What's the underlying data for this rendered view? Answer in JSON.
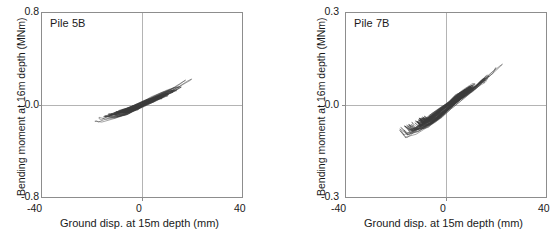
{
  "figure": {
    "background_color": "#ffffff",
    "frame_color": "#8d8d8d",
    "gridline_color": "#b4b4b4",
    "series_color": "#3a3a3a"
  },
  "panels": [
    {
      "title": "Pile 5B",
      "xlabel": "Ground disp. at 15m depth (mm)",
      "ylabel": "Bending moment at 16m depth (MNm)",
      "xticks": [
        "-40",
        "0",
        "40"
      ],
      "yticks": [
        "0.8",
        "0.0",
        "-0.8"
      ]
    },
    {
      "title": "Pile 7B",
      "xlabel": "Ground disp. at 15m depth (mm)",
      "ylabel": "Bending moment at 16m depth (MNm)",
      "xticks": [
        "-40",
        "0",
        "40"
      ],
      "yticks": [
        "0.3",
        "0.0",
        "-0.3"
      ]
    }
  ],
  "chart_data": [
    {
      "type": "line",
      "title": "Pile 5B",
      "xlabel": "Ground disp. at 15m depth (mm)",
      "ylabel": "Bending moment at 16m depth (MNm)",
      "xlim": [
        -40,
        40
      ],
      "ylim": [
        -0.8,
        0.8
      ],
      "xticks": [
        -40,
        0,
        40
      ],
      "yticks": [
        -0.8,
        0.0,
        0.8
      ],
      "grid": "zero-axes-only",
      "legend": "none",
      "description": "Hysteresis loops of bending moment versus ground displacement; narrow elongated cycles with positive slope passing through the origin.",
      "loops": [
        {
          "name": "outer-envelope",
          "x": [
            -20,
            -17,
            -12,
            -6,
            0,
            6,
            11,
            16,
            20,
            22,
            21,
            18,
            13,
            7,
            1,
            -5,
            -11,
            -16,
            -19,
            -20
          ],
          "y": [
            -0.14,
            -0.16,
            -0.13,
            -0.08,
            -0.01,
            0.07,
            0.13,
            0.18,
            0.23,
            0.25,
            0.24,
            0.2,
            0.14,
            0.08,
            0.02,
            -0.04,
            -0.09,
            -0.13,
            -0.15,
            -0.14
          ]
        },
        {
          "name": "mid-loop-1",
          "x": [
            -16,
            -12,
            -7,
            -2,
            4,
            9,
            14,
            16,
            14,
            10,
            5,
            0,
            -5,
            -10,
            -14,
            -16
          ],
          "y": [
            -0.11,
            -0.12,
            -0.09,
            -0.04,
            0.03,
            0.08,
            0.13,
            0.15,
            0.15,
            0.12,
            0.07,
            0.02,
            -0.03,
            -0.07,
            -0.1,
            -0.11
          ]
        },
        {
          "name": "mid-loop-2",
          "x": [
            -13,
            -9,
            -5,
            0,
            5,
            9,
            12,
            13,
            11,
            7,
            3,
            -2,
            -7,
            -11,
            -13
          ],
          "y": [
            -0.09,
            -0.09,
            -0.06,
            -0.01,
            0.04,
            0.08,
            0.11,
            0.12,
            0.11,
            0.08,
            0.05,
            0.0,
            -0.04,
            -0.07,
            -0.09
          ]
        },
        {
          "name": "core-cluster",
          "x": [
            -10,
            -7,
            -3,
            1,
            5,
            8,
            10,
            9,
            6,
            2,
            -2,
            -6,
            -9,
            -10
          ],
          "y": [
            -0.07,
            -0.07,
            -0.04,
            0.01,
            0.05,
            0.08,
            0.09,
            0.09,
            0.06,
            0.02,
            -0.02,
            -0.05,
            -0.07,
            -0.07
          ]
        }
      ]
    },
    {
      "type": "line",
      "title": "Pile 7B",
      "xlabel": "Ground disp. at 15m depth (mm)",
      "ylabel": "Bending moment at 16m depth (MNm)",
      "xlim": [
        -40,
        40
      ],
      "ylim": [
        -0.3,
        0.3
      ],
      "xticks": [
        -40,
        0,
        40
      ],
      "yticks": [
        -0.3,
        0.0,
        0.3
      ],
      "grid": "zero-axes-only",
      "legend": "none",
      "description": "Hysteresis loops of bending moment versus ground displacement; broader S-shaped cycles with positive slope passing near the origin, wider spread than Pile 5B.",
      "loops": [
        {
          "name": "outer-envelope",
          "x": [
            -19,
            -21,
            -19,
            -14,
            -8,
            -1,
            6,
            12,
            17,
            21,
            24,
            25,
            23,
            19,
            13,
            6,
            -1,
            -8,
            -14,
            -18,
            -19
          ],
          "y": [
            -0.12,
            -0.1,
            -0.12,
            -0.11,
            -0.08,
            -0.03,
            0.02,
            0.06,
            0.09,
            0.12,
            0.14,
            0.15,
            0.13,
            0.1,
            0.06,
            0.02,
            -0.02,
            -0.06,
            -0.1,
            -0.12,
            -0.12
          ]
        },
        {
          "name": "mid-loop-1",
          "x": [
            -17,
            -19,
            -16,
            -11,
            -5,
            2,
            8,
            13,
            17,
            19,
            18,
            14,
            9,
            3,
            -3,
            -9,
            -14,
            -17
          ],
          "y": [
            -0.1,
            -0.08,
            -0.1,
            -0.09,
            -0.06,
            -0.01,
            0.03,
            0.06,
            0.09,
            0.1,
            0.1,
            0.07,
            0.04,
            0.01,
            -0.03,
            -0.06,
            -0.09,
            -0.1
          ]
        },
        {
          "name": "mid-loop-2",
          "x": [
            -14,
            -16,
            -13,
            -8,
            -3,
            3,
            8,
            12,
            14,
            13,
            9,
            4,
            -1,
            -7,
            -12,
            -14
          ],
          "y": [
            -0.09,
            -0.07,
            -0.09,
            -0.08,
            -0.05,
            0.0,
            0.04,
            0.06,
            0.08,
            0.08,
            0.06,
            0.03,
            -0.01,
            -0.05,
            -0.08,
            -0.09
          ]
        },
        {
          "name": "core-cluster",
          "x": [
            -11,
            -13,
            -10,
            -6,
            -1,
            4,
            8,
            11,
            12,
            10,
            6,
            2,
            -3,
            -8,
            -11
          ],
          "y": [
            -0.07,
            -0.06,
            -0.07,
            -0.06,
            -0.03,
            0.01,
            0.04,
            0.06,
            0.07,
            0.06,
            0.04,
            0.01,
            -0.02,
            -0.05,
            -0.07
          ]
        }
      ]
    }
  ]
}
